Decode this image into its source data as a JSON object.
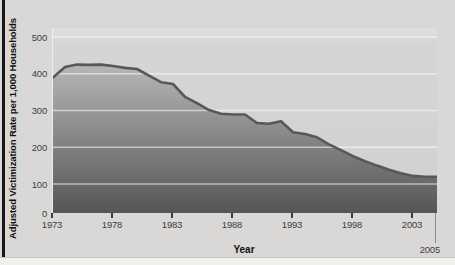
{
  "figure": {
    "y_axis_title": "Adjusted Victimization Rate per 1,000 Households",
    "x_axis_title": "Year",
    "end_year_label": "2005"
  },
  "chart_data": {
    "type": "area",
    "title": "",
    "xlabel": "Year",
    "ylabel": "Adjusted Victimization Rate per 1,000 Households",
    "x": [
      1973,
      1974,
      1975,
      1976,
      1977,
      1978,
      1979,
      1980,
      1981,
      1982,
      1983,
      1984,
      1985,
      1986,
      1987,
      1988,
      1989,
      1990,
      1991,
      1992,
      1993,
      1994,
      1995,
      1996,
      1997,
      1998,
      1999,
      2000,
      2001,
      2002,
      2003,
      2004,
      2005
    ],
    "values": [
      390,
      418,
      425,
      424,
      425,
      421,
      416,
      413,
      395,
      377,
      372,
      337,
      320,
      301,
      291,
      289,
      289,
      266,
      264,
      271,
      241,
      236,
      227,
      208,
      192,
      176,
      162,
      150,
      139,
      129,
      122,
      120,
      120
    ],
    "xlim": [
      1973,
      2005
    ],
    "ylim": [
      0,
      500
    ],
    "x_tick_years": [
      1973,
      1978,
      1983,
      1988,
      1993,
      1998,
      2003
    ],
    "x_tick_labels": [
      "1973",
      "1978",
      "1983",
      "1988",
      "1993",
      "1998",
      "2003"
    ],
    "end_tick_year": 2005,
    "y_tick_values": [
      0,
      100,
      200,
      300,
      400,
      500
    ],
    "grid": "horizontal-white-lines",
    "legend": "none",
    "line_color": "#58585a",
    "area_gradient_top": "#b6b6b4",
    "area_gradient_bottom": "#555557",
    "gridline_color": "rgba(255,255,255,0.55)"
  },
  "colors": {
    "figure_bg": "#d9d8d6",
    "page_bg": "#f1efec",
    "plot_bg_top": "#e0dfdd",
    "plot_bg_bottom": "#d2d1cf",
    "tick_text": "#3f3f3f",
    "axis_title_text": "#111111",
    "left_rule": "#171717"
  }
}
